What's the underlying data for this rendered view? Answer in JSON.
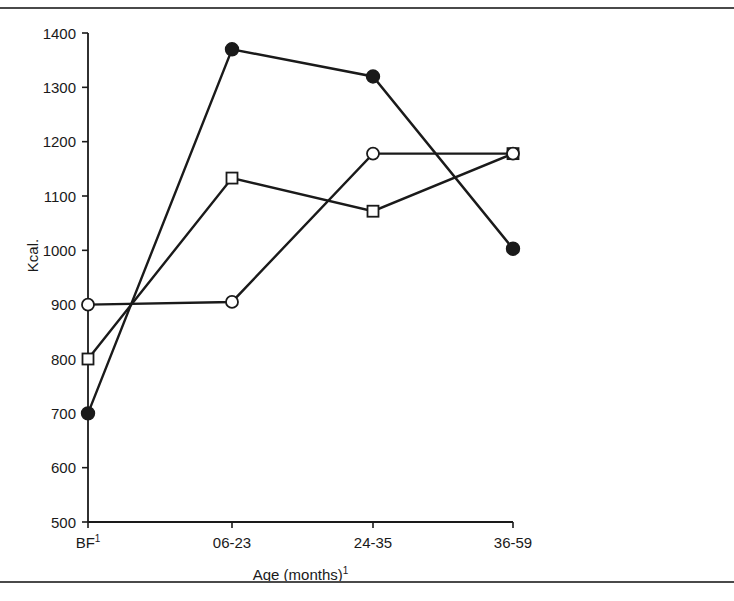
{
  "figure": {
    "background": "#ffffff",
    "rule_color": "#4a4a4a",
    "ink_color": "#1a1a1a"
  },
  "chart_data": {
    "type": "line",
    "title": "",
    "xlabel": "Age (months)",
    "xlabel_sup": "1",
    "ylabel": "Kcal.",
    "categories": [
      "BF",
      "06-23",
      "24-35",
      "36-59"
    ],
    "category_sup": [
      "1",
      "",
      "",
      ""
    ],
    "ylim": [
      500,
      1400
    ],
    "yticks": [
      500,
      600,
      700,
      800,
      900,
      1000,
      1100,
      1200,
      1300,
      1400
    ],
    "grid": false,
    "legend": "none",
    "series": [
      {
        "name": "filled-circle-series",
        "marker": "filled-circle",
        "values": [
          700,
          1370,
          1320,
          1003
        ]
      },
      {
        "name": "open-square-series",
        "marker": "open-square",
        "values": [
          800,
          1133,
          1072,
          1178
        ]
      },
      {
        "name": "open-circle-series",
        "marker": "open-circle",
        "values": [
          900,
          905,
          1178,
          1178
        ]
      }
    ]
  },
  "plot_geometry": {
    "x_positions": [
      88,
      232,
      373,
      513
    ],
    "y_top_px": 33,
    "y_bottom_px": 522,
    "axis_x_px": 88,
    "tick_len": 6,
    "marker_radius": 6.5,
    "square_size": 11,
    "line_width": 2.4
  }
}
